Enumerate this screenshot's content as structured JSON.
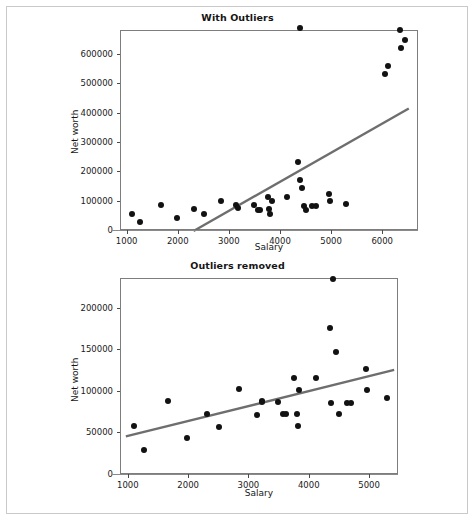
{
  "figure": {
    "width": 475,
    "height": 521,
    "background": "#ffffff",
    "border_color": "#c9c9c9",
    "point_color": "#121212",
    "trend_color": "#6e6e6e",
    "axis_color": "#7d7d7d"
  },
  "chart_data": [
    {
      "type": "scatter",
      "title": "With Outliers",
      "xlabel": "Salary",
      "ylabel": "Net worth",
      "xlim": [
        870,
        6700
      ],
      "ylim": [
        0,
        681000
      ],
      "xticks": [
        1000,
        2000,
        3000,
        4000,
        5000,
        6000
      ],
      "xtick_labels": [
        "1000",
        "2000",
        "3000",
        "4000",
        "5000",
        "6000"
      ],
      "yticks": [
        0,
        100000,
        200000,
        300000,
        400000,
        500000,
        600000
      ],
      "ytick_labels": [
        "0",
        "100000",
        "200000",
        "300000",
        "400000",
        "500000",
        "600000"
      ],
      "grid": false,
      "legend": null,
      "points": [
        [
          1080,
          58800
        ],
        [
          1250,
          30200
        ],
        [
          1650,
          88600
        ],
        [
          1960,
          44100
        ],
        [
          2300,
          73500
        ],
        [
          2500,
          58300
        ],
        [
          2820,
          103300
        ],
        [
          3120,
          88200
        ],
        [
          3150,
          77500
        ],
        [
          3480,
          88500
        ],
        [
          3560,
          73100
        ],
        [
          3590,
          73000
        ],
        [
          3740,
          114700
        ],
        [
          3760,
          73400
        ],
        [
          3790,
          58600
        ],
        [
          3820,
          101500
        ],
        [
          4110,
          116800
        ],
        [
          4340,
          235500
        ],
        [
          4370,
          174800
        ],
        [
          4380,
          690000
        ],
        [
          4420,
          146200
        ],
        [
          4450,
          86500
        ],
        [
          4490,
          72900
        ],
        [
          4610,
          86100
        ],
        [
          4680,
          86300
        ],
        [
          4940,
          124800
        ],
        [
          4960,
          102600
        ],
        [
          5280,
          92400
        ],
        [
          6040,
          533800
        ],
        [
          6090,
          563500
        ],
        [
          6350,
          621800
        ],
        [
          6320,
          684000
        ],
        [
          6430,
          651400
        ]
      ],
      "trend_line": {
        "x0": 2290,
        "y0": 0,
        "x1": 6500,
        "y1": 417000
      }
    },
    {
      "type": "scatter",
      "title": "Outliers removed",
      "xlabel": "Salary",
      "ylabel": "Net worth",
      "xlim": [
        870,
        5480
      ],
      "ylim": [
        0,
        236000
      ],
      "xticks": [
        1000,
        2000,
        3000,
        4000,
        5000
      ],
      "xtick_labels": [
        "1000",
        "2000",
        "3000",
        "4000",
        "5000"
      ],
      "yticks": [
        0,
        50000,
        100000,
        150000,
        200000
      ],
      "ytick_labels": [
        "0",
        "50000",
        "100000",
        "150000",
        "200000"
      ],
      "grid": false,
      "legend": null,
      "points": [
        [
          1080,
          58800
        ],
        [
          1250,
          30200
        ],
        [
          1650,
          88600
        ],
        [
          1960,
          44100
        ],
        [
          2300,
          73500
        ],
        [
          2500,
          58300
        ],
        [
          2820,
          103300
        ],
        [
          3120,
          72800
        ],
        [
          3200,
          88600
        ],
        [
          3210,
          87400
        ],
        [
          3480,
          88500
        ],
        [
          3560,
          73100
        ],
        [
          3600,
          73000
        ],
        [
          3740,
          117200
        ],
        [
          3790,
          73400
        ],
        [
          3800,
          58600
        ],
        [
          3820,
          102200
        ],
        [
          4110,
          117000
        ],
        [
          4340,
          177000
        ],
        [
          4380,
          236500
        ],
        [
          4360,
          86800
        ],
        [
          4430,
          148200
        ],
        [
          4480,
          72900
        ],
        [
          4610,
          86400
        ],
        [
          4680,
          86600
        ],
        [
          4940,
          128000
        ],
        [
          4950,
          102600
        ],
        [
          5280,
          92800
        ]
      ],
      "trend_line": {
        "x0": 950,
        "y0": 46500,
        "x1": 5400,
        "y1": 126500
      }
    }
  ]
}
